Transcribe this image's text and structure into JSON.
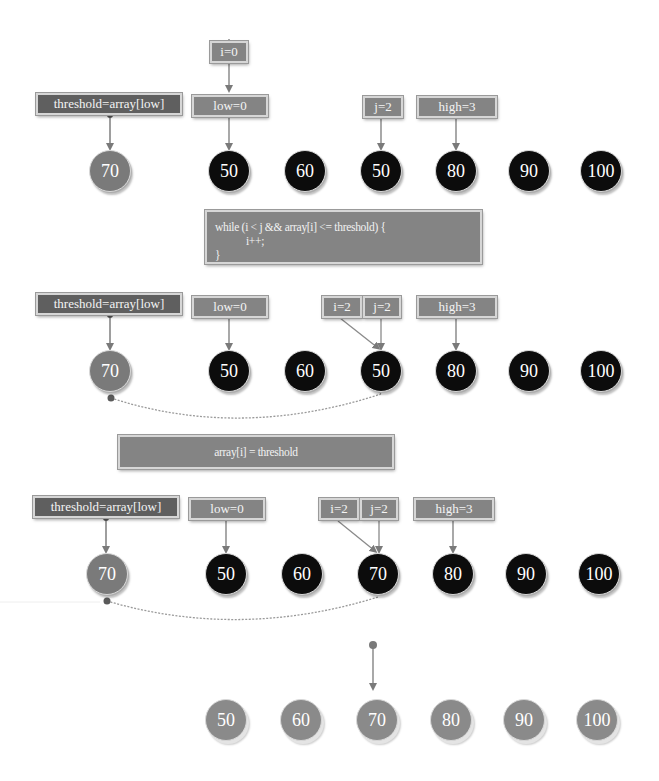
{
  "diagram": {
    "colors": {
      "label_bg": "#848484",
      "label_dark_bg": "#5f5f5f",
      "node_black": "#0c0c0c",
      "node_gray": "#7a7a7a",
      "arrow": "#7a7a7a"
    }
  },
  "step1": {
    "labels": {
      "i": "i=0",
      "low": "low=0",
      "j": "j=2",
      "high": "high=3",
      "threshold": "threshold=array[low]"
    },
    "threshold_node": "70",
    "nodes": [
      "50",
      "60",
      "50",
      "80",
      "90",
      "100"
    ]
  },
  "code1": {
    "line1": "while (i < j && array[i] <= threshold) {",
    "line2": "            i++;",
    "line3": "}"
  },
  "step2": {
    "labels": {
      "threshold": "threshold=array[low]",
      "low": "low=0",
      "i": "i=2",
      "j": "j=2",
      "high": "high=3"
    },
    "threshold_node": "70",
    "nodes": [
      "50",
      "60",
      "50",
      "80",
      "90",
      "100"
    ]
  },
  "code2": {
    "line1": "array[i] = threshold"
  },
  "step3": {
    "labels": {
      "threshold": "threshold=array[low]",
      "low": "low=0",
      "i": "i=2",
      "j": "j=2",
      "high": "high=3"
    },
    "threshold_node": "70",
    "nodes": [
      "50",
      "60",
      "70",
      "80",
      "90",
      "100"
    ]
  },
  "result": {
    "nodes": [
      "50",
      "60",
      "70",
      "80",
      "90",
      "100"
    ]
  }
}
